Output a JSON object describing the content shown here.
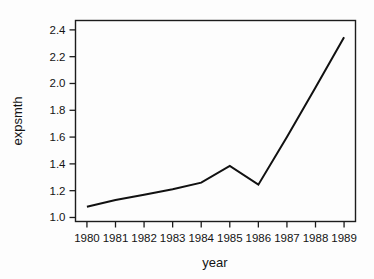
{
  "figure": {
    "background_color": "#fdfdfd",
    "foreground_color": "#141414",
    "line_color": "#111111"
  },
  "chart_data": {
    "type": "line",
    "title": "",
    "xlabel": "year",
    "ylabel": "expsmth",
    "x": [
      1980,
      1981,
      1982,
      1983,
      1984,
      1985,
      1986,
      1987,
      1988,
      1989
    ],
    "categories": [
      "1980",
      "1981",
      "1982",
      "1983",
      "1984",
      "1985",
      "1986",
      "1987",
      "1988",
      "1989"
    ],
    "values": [
      1.08,
      1.13,
      1.17,
      1.21,
      1.26,
      1.385,
      1.245,
      1.6,
      1.97,
      2.345
    ],
    "series": [
      {
        "name": "expsmth",
        "values": [
          1.08,
          1.13,
          1.17,
          1.21,
          1.26,
          1.385,
          1.245,
          1.6,
          1.97,
          2.345
        ]
      }
    ],
    "xlim": [
      1979.6,
      1989.4
    ],
    "ylim": [
      0.97,
      2.47
    ],
    "xticks": [
      1980,
      1981,
      1982,
      1983,
      1984,
      1985,
      1986,
      1987,
      1988,
      1989
    ],
    "xtick_labels": [
      "1980",
      "1981",
      "1982",
      "1983",
      "1984",
      "1985",
      "1986",
      "1987",
      "1988",
      "1989"
    ],
    "yticks": [
      1.0,
      1.2,
      1.4,
      1.6,
      1.8,
      2.0,
      2.2,
      2.4
    ],
    "ytick_labels": [
      "1.0",
      "1.2",
      "1.4",
      "1.6",
      "1.8",
      "2.0",
      "2.2",
      "2.4"
    ],
    "grid": false,
    "legend": false,
    "legend_position": "none",
    "annotations": []
  }
}
